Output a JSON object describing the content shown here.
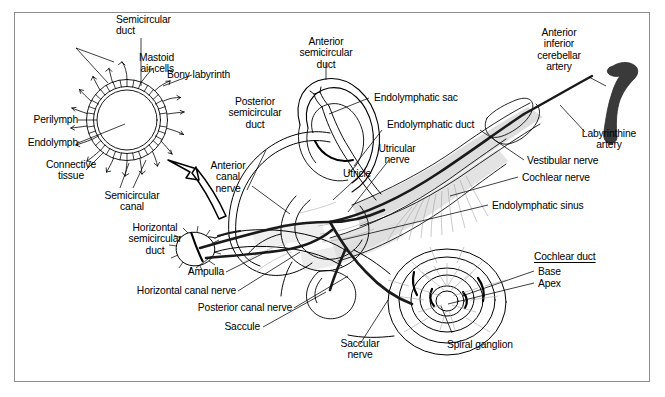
{
  "figure": {
    "domain": "anatomical-diagram",
    "background": "#ffffff",
    "frame_color": "#8d8d8d",
    "ink_color": "#000000",
    "artery_color": "#3a3a3a",
    "nerve_sheath_color": "#d8d8d8",
    "shading_color": "#b9b9b9"
  },
  "labels": {
    "semicircular_duct": "Semicircular\nduct",
    "mastoid_air_cells": "Mastoid\nair cells",
    "bony_labyrinth": "Bony labyrinth",
    "perilymph": "Perilymph",
    "endolymph": "Endolymph",
    "connective_tissue": "Connective\ntissue",
    "semicircular_canal": "Semicircular\ncanal",
    "anterior_semicircular_duct": "Anterior\nsemicircular\nduct",
    "posterior_semicircular_duct": "Posterior\nsemicircular\nduct",
    "anterior_canal_nerve": "Anterior\ncanal\nnerve",
    "horizontal_semicircular_duct": "Horizontal\nsemicircular\nduct",
    "ampulla": "Ampulla",
    "horizontal_canal_nerve": "Horizontal canal nerve",
    "posterior_canal_nerve": "Posterior canal nerve",
    "saccule": "Saccule",
    "saccular_nerve": "Saccular\nnerve",
    "spiral_ganglion": "Spiral ganglion",
    "endolymphatic_sac": "Endolymphatic sac",
    "endolymphatic_duct": "Endolymphatic duct",
    "utricular_nerve": "Utricular\nnerve",
    "utricle": "Utricle",
    "anterior_inferior_cerebellar_artery": "Anterior\ninferior\ncerebellar\nartery",
    "labyrinthine_artery": "Labyrinthine\nartery",
    "vestibular_nerve": "Vestibular nerve",
    "cochlear_nerve": "Cochlear nerve",
    "endolymphatic_sinus": "Endolymphatic sinus",
    "cochlear_duct_heading": "Cochlear duct",
    "cochlear_duct_base": "Base",
    "cochlear_duct_apex": "Apex"
  }
}
